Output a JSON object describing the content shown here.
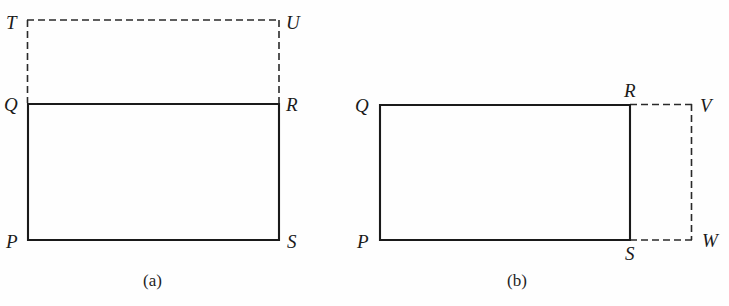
{
  "figure": {
    "background_color": "#fefefe",
    "stroke_color": "#1a1a1a solid",
    "solid_color": "#1a1a1a",
    "dashed_color": "#2a2a2a",
    "panels": [
      {
        "id": "panel-a",
        "caption": "(a)",
        "caption_pos": {
          "x": 143,
          "y": 272
        },
        "solid_rect": {
          "x": 27,
          "y": 103,
          "w": 252,
          "h": 137
        },
        "dashed_rect": {
          "x": 27,
          "y": 20,
          "w": 252,
          "h": 83
        },
        "vertices": [
          {
            "name": "T",
            "label": "T",
            "x": 6,
            "y": 13,
            "style": "dashed-corner"
          },
          {
            "name": "U",
            "label": "U",
            "x": 286,
            "y": 13,
            "style": "dashed-corner"
          },
          {
            "name": "Q",
            "label": "Q",
            "x": 4,
            "y": 95,
            "style": "solid-corner"
          },
          {
            "name": "R",
            "label": "R",
            "x": 286,
            "y": 95,
            "style": "solid-corner"
          },
          {
            "name": "P",
            "label": "P",
            "x": 6,
            "y": 232,
            "style": "solid-corner"
          },
          {
            "name": "S",
            "label": "S",
            "x": 287,
            "y": 232,
            "style": "solid-corner"
          }
        ]
      },
      {
        "id": "panel-b",
        "caption": "(b)",
        "caption_pos": {
          "x": 507,
          "y": 272
        },
        "solid_rect": {
          "x": 379,
          "y": 104,
          "w": 251,
          "h": 136
        },
        "dashed_rect": {
          "x": 630,
          "y": 104,
          "w": 62,
          "h": 136
        },
        "vertices": [
          {
            "name": "Q",
            "label": "Q",
            "x": 355,
            "y": 96,
            "style": "solid-corner"
          },
          {
            "name": "R",
            "label": "R",
            "x": 624,
            "y": 81,
            "style": "solid-corner"
          },
          {
            "name": "P",
            "label": "P",
            "x": 357,
            "y": 232,
            "style": "solid-corner"
          },
          {
            "name": "S",
            "label": "S",
            "x": 625,
            "y": 244,
            "style": "solid-corner"
          },
          {
            "name": "V",
            "label": "V",
            "x": 700,
            "y": 96,
            "style": "dashed-corner"
          },
          {
            "name": "W",
            "label": "W",
            "x": 702,
            "y": 231,
            "style": "dashed-corner"
          }
        ]
      }
    ]
  }
}
